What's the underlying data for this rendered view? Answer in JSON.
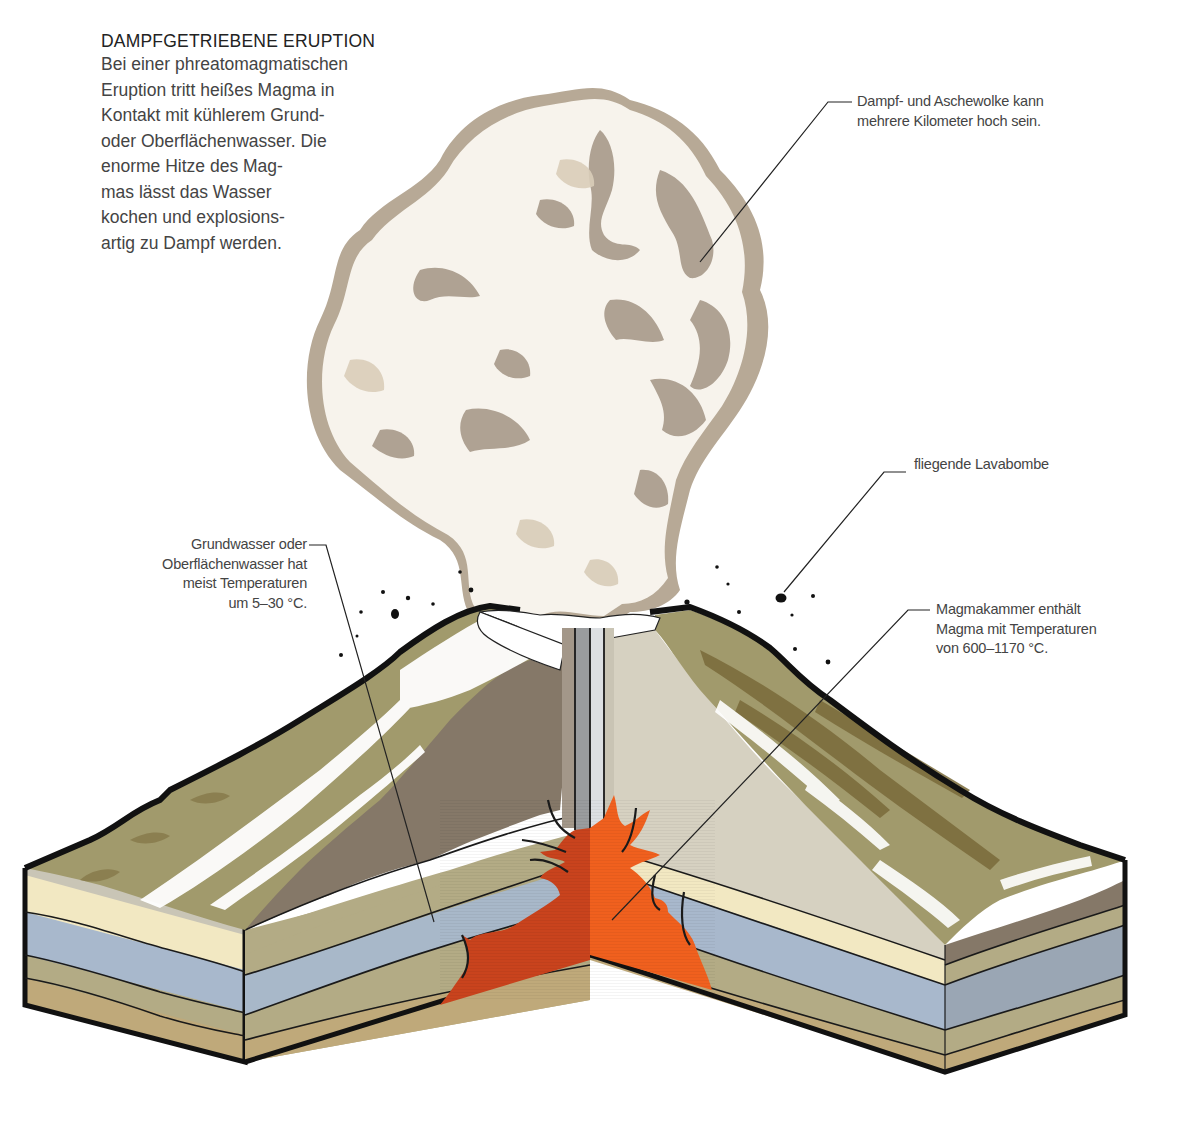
{
  "title": "DAMPFGETRIEBENE ERUPTION",
  "intro_lines": [
    "Bei einer phreatomagmatischen",
    "Eruption tritt heißes Magma in",
    "Kontakt mit kühlerem Grund-",
    "oder Oberflächenwasser. Die",
    "enorme Hitze des Mag-",
    "mas lässt das Wasser",
    "kochen und explosions-",
    "artig zu Dampf werden."
  ],
  "labels": {
    "cloud": {
      "lines": [
        "Dampf- und Aschewolke kann",
        "mehrere Kilometer hoch sein."
      ]
    },
    "groundwater": {
      "lines": [
        "Grundwasser oder",
        "Oberflächenwasser hat",
        "meist Temperaturen",
        "um 5–30 °C."
      ]
    },
    "lava_bomb": {
      "lines": [
        "fliegende Lavabombe"
      ]
    },
    "magma_chamber": {
      "lines": [
        "Magmakammer enthält",
        "Magma mit Temperaturen",
        "von 600–1170 °C."
      ]
    }
  },
  "colors": {
    "cloud_light": "#ebe3d6",
    "cloud_shadow": "#a89a89",
    "slope_olive": "#a19a6c",
    "slope_dark": "#7a6a3a",
    "section_brown": "#857868",
    "section_light": "#d6d1c1",
    "layer_cream": "#f2e8c2",
    "layer_blue": "#a8b8cc",
    "layer_olive": "#b3ab85",
    "layer_tan": "#bfa97a",
    "magma_dark": "#c9431d",
    "magma_bright": "#f0601e",
    "vent_grey": "#b9bcbf",
    "outline": "#111111"
  }
}
